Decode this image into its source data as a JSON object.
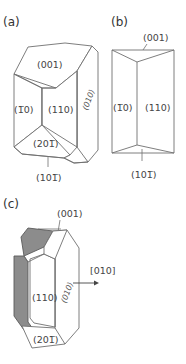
{
  "figure": {
    "panels": [
      {
        "id": "a",
        "label": "(a)",
        "faces": {
          "top": "(001)",
          "left_prism": "(1̅0)",
          "right_prism": "(110)",
          "side": "(010)",
          "bottom_front": "(201̅)",
          "bottom": "(101̅)"
        }
      },
      {
        "id": "b",
        "label": "(b)",
        "faces": {
          "top": "(001)",
          "left_prism": "(1̅0)",
          "right_prism": "(110)",
          "bottom": "(101̅)"
        }
      },
      {
        "id": "c",
        "label": "(c)",
        "faces": {
          "top": "(001)",
          "front": "(110)",
          "side": "(010)",
          "bottom": "(201̅)"
        },
        "axis_label": "[010]"
      }
    ],
    "colors": {
      "edge": "#6f6f6f",
      "shaded_face": "#8c8c8c",
      "text": "#444444"
    }
  }
}
